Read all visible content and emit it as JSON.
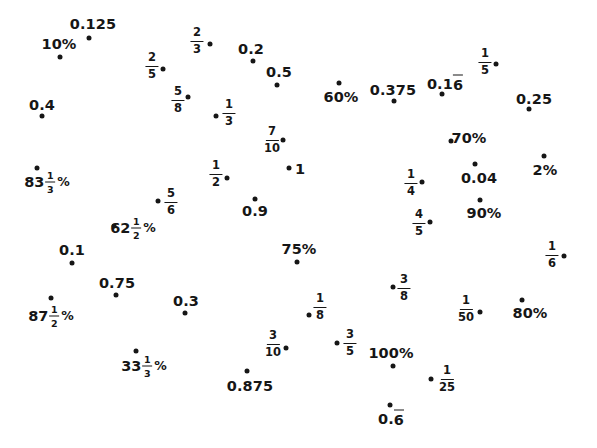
{
  "figure": {
    "width": 597,
    "height": 448,
    "background": "#ffffff",
    "ink_color": "#161616",
    "items": [
      {
        "kind": "text",
        "text": "0.125",
        "lx": 93,
        "ly": 24,
        "dx": 89,
        "dy": 38
      },
      {
        "kind": "text",
        "text": "10%",
        "lx": 59,
        "ly": 44,
        "dx": 60,
        "dy": 57
      },
      {
        "kind": "frac",
        "num": "2",
        "den": "3",
        "lx": 197,
        "ly": 41,
        "dx": 210,
        "dy": 44
      },
      {
        "kind": "text",
        "text": "0.2",
        "lx": 251,
        "ly": 49,
        "dx": 253,
        "dy": 61
      },
      {
        "kind": "frac",
        "num": "2",
        "den": "5",
        "lx": 152,
        "ly": 66,
        "dx": 163,
        "dy": 69
      },
      {
        "kind": "frac",
        "num": "1",
        "den": "5",
        "lx": 485,
        "ly": 62,
        "dx": 496,
        "dy": 64
      },
      {
        "kind": "text",
        "text": "0.5",
        "lx": 279,
        "ly": 72,
        "dx": 277,
        "dy": 85
      },
      {
        "kind": "rep",
        "prefix": "0.1",
        "repeat": "6",
        "lx": 445,
        "ly": 83,
        "dx": 442,
        "dy": 94
      },
      {
        "kind": "text",
        "text": "60%",
        "lx": 341,
        "ly": 97,
        "dx": 339,
        "dy": 83
      },
      {
        "kind": "text",
        "text": "0.375",
        "lx": 393,
        "ly": 90,
        "dx": 394,
        "dy": 101
      },
      {
        "kind": "frac",
        "num": "5",
        "den": "8",
        "lx": 178,
        "ly": 100,
        "dx": 188,
        "dy": 97
      },
      {
        "kind": "text",
        "text": "0.4",
        "lx": 42,
        "ly": 105,
        "dx": 42,
        "dy": 116
      },
      {
        "kind": "text",
        "text": "0.25",
        "lx": 534,
        "ly": 99,
        "dx": 529,
        "dy": 109
      },
      {
        "kind": "frac",
        "num": "1",
        "den": "3",
        "lx": 229,
        "ly": 113,
        "dx": 216,
        "dy": 116
      },
      {
        "kind": "frac",
        "num": "7",
        "den": "10",
        "lx": 272,
        "ly": 140,
        "dx": 283,
        "dy": 140
      },
      {
        "kind": "text",
        "text": "70%",
        "lx": 469,
        "ly": 138,
        "dx": 451,
        "dy": 141
      },
      {
        "kind": "text",
        "text": "1",
        "lx": 300,
        "ly": 169,
        "dx": 289,
        "dy": 168
      },
      {
        "kind": "text",
        "text": "2%",
        "lx": 545,
        "ly": 170,
        "dx": 544,
        "dy": 156
      },
      {
        "kind": "frac",
        "num": "1",
        "den": "2",
        "lx": 216,
        "ly": 174,
        "dx": 227,
        "dy": 178
      },
      {
        "kind": "text",
        "text": "0.04",
        "lx": 479,
        "ly": 178,
        "dx": 475,
        "dy": 164
      },
      {
        "kind": "mixedpct",
        "whole": "83",
        "num": "1",
        "den": "3",
        "suffix": "%",
        "lx": 47,
        "ly": 182,
        "dx": 37,
        "dy": 168
      },
      {
        "kind": "frac",
        "num": "1",
        "den": "4",
        "lx": 411,
        "ly": 183,
        "dx": 422,
        "dy": 182
      },
      {
        "kind": "frac",
        "num": "5",
        "den": "6",
        "lx": 171,
        "ly": 202,
        "dx": 158,
        "dy": 201
      },
      {
        "kind": "text",
        "text": "0.9",
        "lx": 255,
        "ly": 211,
        "dx": 255,
        "dy": 199
      },
      {
        "kind": "text",
        "text": "90%",
        "lx": 484,
        "ly": 213,
        "dx": 480,
        "dy": 200
      },
      {
        "kind": "frac",
        "num": "4",
        "den": "5",
        "lx": 419,
        "ly": 223,
        "dx": 430,
        "dy": 222
      },
      {
        "kind": "mixedpct",
        "whole": "62",
        "num": "1",
        "den": "2",
        "suffix": "%",
        "lx": 133,
        "ly": 228,
        "dx": 114,
        "dy": 226
      },
      {
        "kind": "text",
        "text": "0.1",
        "lx": 72,
        "ly": 250,
        "dx": 72,
        "dy": 263
      },
      {
        "kind": "text",
        "text": "75%",
        "lx": 299,
        "ly": 249,
        "dx": 297,
        "dy": 262
      },
      {
        "kind": "frac",
        "num": "1",
        "den": "6",
        "lx": 552,
        "ly": 255,
        "dx": 564,
        "dy": 256
      },
      {
        "kind": "text",
        "text": "0.75",
        "lx": 117,
        "ly": 283,
        "dx": 116,
        "dy": 295
      },
      {
        "kind": "frac",
        "num": "3",
        "den": "8",
        "lx": 404,
        "ly": 288,
        "dx": 393,
        "dy": 287
      },
      {
        "kind": "mixedpct",
        "whole": "87",
        "num": "1",
        "den": "2",
        "suffix": "%",
        "lx": 51,
        "ly": 316,
        "dx": 51,
        "dy": 298
      },
      {
        "kind": "text",
        "text": "0.3",
        "lx": 186,
        "ly": 301,
        "dx": 185,
        "dy": 313
      },
      {
        "kind": "frac",
        "num": "1",
        "den": "8",
        "lx": 320,
        "ly": 307,
        "dx": 309,
        "dy": 315
      },
      {
        "kind": "frac",
        "num": "1",
        "den": "50",
        "lx": 466,
        "ly": 309,
        "dx": 480,
        "dy": 312
      },
      {
        "kind": "text",
        "text": "80%",
        "lx": 530,
        "ly": 313,
        "dx": 522,
        "dy": 300
      },
      {
        "kind": "frac",
        "num": "3",
        "den": "10",
        "lx": 273,
        "ly": 344,
        "dx": 286,
        "dy": 348
      },
      {
        "kind": "frac",
        "num": "3",
        "den": "5",
        "lx": 350,
        "ly": 343,
        "dx": 337,
        "dy": 343
      },
      {
        "kind": "mixedpct",
        "whole": "33",
        "num": "1",
        "den": "3",
        "suffix": "%",
        "lx": 144,
        "ly": 366,
        "dx": 136,
        "dy": 351
      },
      {
        "kind": "text",
        "text": "100%",
        "lx": 391,
        "ly": 353,
        "dx": 393,
        "dy": 366
      },
      {
        "kind": "text",
        "text": "0.875",
        "lx": 250,
        "ly": 386,
        "dx": 247,
        "dy": 371
      },
      {
        "kind": "frac",
        "num": "1",
        "den": "25",
        "lx": 447,
        "ly": 379,
        "dx": 431,
        "dy": 379
      },
      {
        "kind": "rep",
        "prefix": "0.",
        "repeat": "6",
        "lx": 391,
        "ly": 418,
        "dx": 390,
        "dy": 405
      }
    ]
  }
}
